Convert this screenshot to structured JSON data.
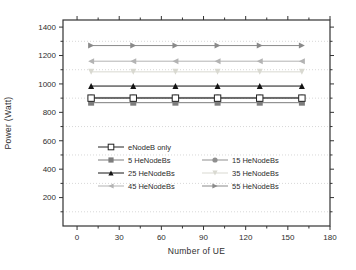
{
  "figure": {
    "background": "#ffffff",
    "axis_color": "#333333",
    "tick_label_color": "#2e2e2e",
    "grid_color": "#d8d8d8"
  },
  "chart_data": {
    "type": "line",
    "title": "",
    "xlabel": "Number of UE",
    "ylabel": "Power (Watt)",
    "xlim": [
      -10,
      180
    ],
    "ylim": [
      0,
      1450
    ],
    "x_ticks": [
      0,
      30,
      60,
      90,
      120,
      150,
      180
    ],
    "x_minor_ticks": [
      15,
      45,
      75,
      105,
      135,
      165
    ],
    "y_ticks": [
      200,
      400,
      600,
      800,
      1000,
      1200,
      1400
    ],
    "y_minor_ticks": [
      100,
      300,
      500,
      700,
      900,
      1100,
      1300
    ],
    "gridlines_y": [
      100,
      300,
      500,
      700,
      900,
      1100,
      1300
    ],
    "grid_style": "dotted horizontal",
    "legend_position": "inside lower-center, no frame, 2 columns",
    "x": [
      10,
      40,
      70,
      100,
      130,
      160
    ],
    "series": [
      {
        "name": "eNodeB only",
        "marker": "square-open",
        "color": "#222222",
        "values": [
          900,
          900,
          900,
          900,
          900,
          900
        ]
      },
      {
        "name": "5 HeNodeBs",
        "marker": "square",
        "color": "#7d7d7d",
        "values": [
          868,
          868,
          868,
          868,
          868,
          868
        ]
      },
      {
        "name": "15 HeNodeBs",
        "marker": "circle",
        "color": "#8f8f8f",
        "values": [
          905,
          905,
          905,
          905,
          905,
          905
        ]
      },
      {
        "name": "25 HeNodeBs",
        "marker": "triangle-up",
        "color": "#141414",
        "values": [
          985,
          985,
          985,
          985,
          985,
          985
        ]
      },
      {
        "name": "35 HeNodeBs",
        "marker": "triangle-down",
        "color": "#d9d9d1",
        "values": [
          1085,
          1085,
          1085,
          1085,
          1085,
          1085
        ]
      },
      {
        "name": "45 HeNodeBs",
        "marker": "triangle-left",
        "color": "#b3b3b3",
        "values": [
          1160,
          1160,
          1160,
          1160,
          1160,
          1160
        ]
      },
      {
        "name": "55 HeNodeBs",
        "marker": "triangle-right",
        "color": "#8a8a8a",
        "values": [
          1270,
          1270,
          1270,
          1270,
          1270,
          1270
        ]
      }
    ],
    "legend_rows": [
      [
        "eNodeB only"
      ],
      [
        "5 HeNodeBs",
        "15 HeNodeBs"
      ],
      [
        "25 HeNodeBs",
        "35 HeNodeBs"
      ],
      [
        "45 HeNodeBs",
        "55 HeNodeBs"
      ]
    ]
  }
}
